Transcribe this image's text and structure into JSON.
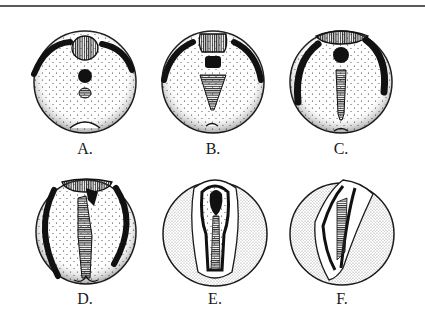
{
  "figure": {
    "panels": [
      {
        "id": "A",
        "label": "A."
      },
      {
        "id": "B",
        "label": "B."
      },
      {
        "id": "C",
        "label": "C."
      },
      {
        "id": "D",
        "label": "D."
      },
      {
        "id": "E",
        "label": "E."
      },
      {
        "id": "F",
        "label": "F."
      }
    ]
  },
  "colors": {
    "ink": "#1a1a1a",
    "rule": "#5a5a5a",
    "background": "#ffffff",
    "hatch": "#3a3a3a"
  }
}
